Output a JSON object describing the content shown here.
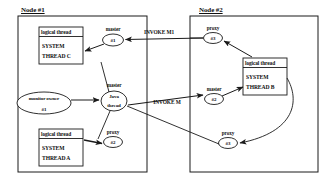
{
  "diagram": {
    "title_hidden": "",
    "nodes": [
      {
        "id": "node1",
        "title": "Node #1",
        "boxes": [
          {
            "id": "thread-c",
            "header": "logical thread",
            "line1": "SYSTEM",
            "line2": "THREAD C"
          },
          {
            "id": "thread-a",
            "header": "logical thread",
            "line1": "SYSTEM",
            "line2": "THREAD A"
          }
        ],
        "ellipses": [
          {
            "id": "master-1",
            "caption": "master",
            "text": "#1"
          },
          {
            "id": "java-thread",
            "line1": "Java",
            "line2": "thread",
            "caption": "master"
          },
          {
            "id": "monitor-owner",
            "line1": "monitor owner",
            "line2": "#1"
          },
          {
            "id": "proxy-2-left",
            "caption": "proxy",
            "text": "#2"
          }
        ]
      },
      {
        "id": "node2",
        "title": "Node #2",
        "boxes": [
          {
            "id": "thread-b",
            "header": "logical thread",
            "line1": "SYSTEM",
            "line2": "THREAD B"
          }
        ],
        "ellipses": [
          {
            "id": "proxy-3-top",
            "caption": "proxy",
            "text": "#3"
          },
          {
            "id": "master-2",
            "caption": "master",
            "text": "#2"
          },
          {
            "id": "proxy-3-bottom",
            "caption": "proxy",
            "text": "#3"
          }
        ]
      }
    ],
    "edge_labels": [
      {
        "id": "invoke-m1",
        "text": "INVOKE M1"
      },
      {
        "id": "invoke-m",
        "text": "INVOKE M"
      }
    ],
    "colors": {
      "stroke": "#1a1a1a",
      "text": "#111111",
      "background": "#ffffff"
    }
  }
}
